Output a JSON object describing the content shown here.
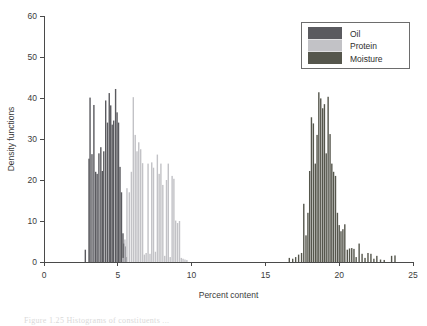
{
  "figure": {
    "background": "#ffffff",
    "axis_color": "#4a4a4a",
    "text_color": "#3b3b3b"
  },
  "legend": {
    "border_color": "#6d6d6d",
    "position": "top-right",
    "items": [
      {
        "label": "Oil",
        "color": "#5a5a5f"
      },
      {
        "label": "Protein",
        "color": "#c2c2c6"
      },
      {
        "label": "Moisture",
        "color": "#55564c"
      }
    ]
  },
  "caption_ghost": "Figure 1.25  Histograms of constituents ...",
  "chart_data": {
    "type": "bar",
    "title": "",
    "subtitle": "",
    "xlabel": "Percent content",
    "ylabel": "Density functions",
    "xlim": [
      0,
      25
    ],
    "ylim": [
      0,
      60
    ],
    "xticks": [
      0,
      5,
      10,
      15,
      20,
      25
    ],
    "yticks": [
      0,
      10,
      20,
      30,
      40,
      50,
      60
    ],
    "grid": false,
    "legend_position": "upper right",
    "bar_width": 0.055,
    "series": [
      {
        "name": "Oil",
        "color": "#5a5a5f",
        "x": [
          2.8,
          3.05,
          3.12,
          3.25,
          3.38,
          3.5,
          3.6,
          3.72,
          3.85,
          3.95,
          4.05,
          4.18,
          4.3,
          4.42,
          4.52,
          4.62,
          4.72,
          4.85,
          4.95,
          5.05,
          5.15,
          5.25,
          5.35,
          5.42,
          5.5,
          5.58
        ],
        "values": [
          3.0,
          25.2,
          40.1,
          26.3,
          38.3,
          22.0,
          21.5,
          26.5,
          28.0,
          22.2,
          27.0,
          39.4,
          34.0,
          41.2,
          38.2,
          33.5,
          34.5,
          42.2,
          36.5,
          34.0,
          23.2,
          17.0,
          7.0,
          4.5,
          3.8,
          1.2
        ]
      },
      {
        "name": "Protein",
        "color": "#c2c2c6",
        "x": [
          5.35,
          5.48,
          5.62,
          5.78,
          5.92,
          6.05,
          6.18,
          6.3,
          6.42,
          6.55,
          6.68,
          6.8,
          6.92,
          7.05,
          7.18,
          7.3,
          7.42,
          7.55,
          7.68,
          7.8,
          7.92,
          8.05,
          8.18,
          8.3,
          8.42,
          8.55,
          8.68,
          8.8,
          8.92,
          9.05,
          9.18,
          9.3,
          9.42,
          9.55,
          9.68
        ],
        "values": [
          1.0,
          5.5,
          18.0,
          17.0,
          22.0,
          40.2,
          31.0,
          27.0,
          29.2,
          27.5,
          24.1,
          1.8,
          2.2,
          24.0,
          2.0,
          24.3,
          23.0,
          2.5,
          26.2,
          21.5,
          24.0,
          18.8,
          1.5,
          20.0,
          24.0,
          1.2,
          21.0,
          20.3,
          10.1,
          9.5,
          10.0,
          1.0,
          0.8,
          0.6,
          0.5
        ]
      },
      {
        "name": "Moisture",
        "color": "#55564c",
        "x": [
          16.62,
          16.85,
          17.05,
          17.25,
          17.45,
          17.6,
          17.75,
          17.88,
          18.0,
          18.12,
          18.25,
          18.38,
          18.5,
          18.62,
          18.75,
          18.88,
          19.0,
          19.12,
          19.25,
          19.38,
          19.5,
          19.62,
          19.75,
          19.88,
          20.0,
          20.12,
          20.25,
          20.38,
          20.55,
          20.7,
          20.85,
          21.0,
          21.15,
          21.35,
          21.55,
          21.75,
          21.95,
          22.15,
          22.35,
          22.55,
          22.8,
          23.05,
          23.55,
          23.78
        ],
        "values": [
          1.0,
          0.8,
          1.2,
          1.8,
          2.2,
          14.2,
          6.5,
          12.0,
          22.2,
          35.3,
          33.8,
          24.0,
          31.0,
          41.4,
          39.9,
          37.5,
          38.5,
          26.5,
          40.3,
          31.2,
          24.0,
          22.0,
          21.0,
          12.0,
          9.0,
          7.5,
          8.0,
          9.2,
          3.0,
          3.3,
          3.4,
          3.2,
          1.2,
          4.5,
          2.0,
          1.0,
          2.2,
          2.0,
          0.8,
          1.5,
          0.6,
          0.5,
          1.5,
          1.6
        ]
      }
    ]
  }
}
